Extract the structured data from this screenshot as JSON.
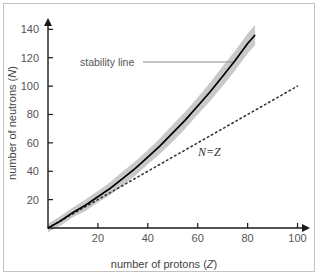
{
  "figure": {
    "border_color": "#c3c3c3",
    "background": "#ffffff"
  },
  "chart_data": {
    "type": "line",
    "title": "",
    "xlabel_plain": "number of protons (Z)",
    "ylabel_plain": "number of neutrons (N)",
    "xlabel_prefix": "number of protons (",
    "xlabel_symbol": "Z",
    "xlabel_suffix": ")",
    "ylabel_prefix": "number of neutrons (",
    "ylabel_symbol": "N",
    "ylabel_suffix": ")",
    "xlim": [
      0,
      105
    ],
    "ylim": [
      0,
      148
    ],
    "xticks": [
      20,
      40,
      60,
      80,
      100
    ],
    "xtick_labels": [
      "20",
      "40",
      "60",
      "80",
      "100"
    ],
    "yticks": [
      20,
      40,
      60,
      80,
      100,
      120,
      140
    ],
    "ytick_labels": [
      "20",
      "40",
      "60",
      "80",
      "100",
      "120",
      "140"
    ],
    "grid": false,
    "legend": "none",
    "axis_arrows": true,
    "series": [
      {
        "name": "stability line",
        "style": "solid",
        "color": "#000000",
        "x": [
          0,
          5,
          10,
          15,
          20,
          25,
          30,
          35,
          40,
          45,
          50,
          55,
          60,
          65,
          70,
          75,
          80,
          83
        ],
        "values": [
          0,
          5,
          11,
          16,
          22,
          28,
          35,
          42,
          50,
          58,
          67,
          76,
          86,
          96,
          107,
          118,
          130,
          136
        ]
      },
      {
        "name": "stability band upper",
        "style": "band-edge",
        "color": "#c8c8c8",
        "x": [
          0,
          5,
          10,
          15,
          20,
          25,
          30,
          35,
          40,
          45,
          50,
          55,
          60,
          65,
          70,
          75,
          80,
          83
        ],
        "values": [
          3,
          8.5,
          14.5,
          20,
          26,
          32.5,
          40,
          47,
          55,
          63.5,
          73,
          82,
          92,
          102.5,
          114,
          125,
          137,
          143
        ]
      },
      {
        "name": "stability band lower",
        "style": "band-edge",
        "color": "#c8c8c8",
        "x": [
          0,
          5,
          10,
          15,
          20,
          25,
          30,
          35,
          40,
          45,
          50,
          55,
          60,
          65,
          70,
          75,
          80,
          83
        ],
        "values": [
          -3,
          1.5,
          7.5,
          12,
          18,
          23.5,
          30,
          37,
          45,
          52.5,
          61,
          70,
          80,
          89.5,
          100,
          111,
          123,
          129
        ]
      },
      {
        "name": "N=Z",
        "style": "dotted",
        "color": "#333333",
        "x": [
          0,
          100
        ],
        "values": [
          0,
          100
        ]
      }
    ],
    "band_fill": "#c9c9c9",
    "annotations": [
      {
        "name": "stability-line-label",
        "text": "stability line",
        "x_px": 80,
        "y_px": 66,
        "leader_from_px": [
          143,
          62
        ],
        "leader_to_px": [
          233,
          62
        ],
        "leader_color": "#8a8a8a"
      },
      {
        "name": "n-equals-z-label",
        "text": "N=Z",
        "x_px": 198,
        "y_px": 156
      }
    ]
  },
  "axes": {
    "color": "#1a1a1a",
    "origin_px": [
      48,
      228
    ],
    "x_end_px": [
      310,
      228
    ],
    "y_end_px": [
      48,
      18
    ]
  }
}
